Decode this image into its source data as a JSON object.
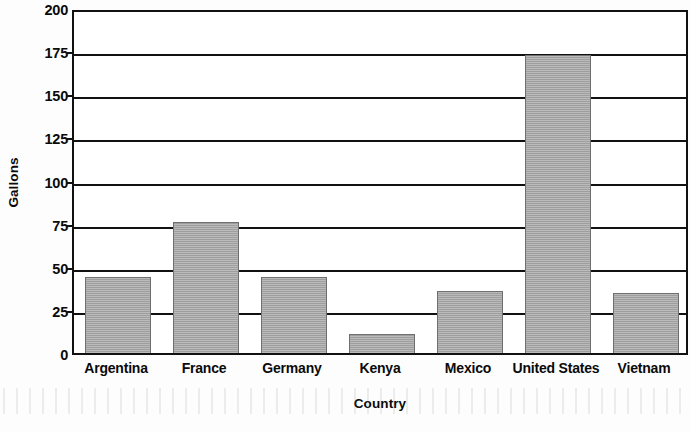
{
  "chart_data": {
    "type": "bar",
    "title": "",
    "xlabel": "Country",
    "ylabel": "Gallons",
    "categories": [
      "Argentina",
      "France",
      "Germany",
      "Kenya",
      "Mexico",
      "United States",
      "Vietnam"
    ],
    "values": [
      44,
      76,
      44,
      11,
      36,
      173,
      35
    ],
    "ylim": [
      0,
      200
    ],
    "yticks": [
      0,
      25,
      50,
      75,
      100,
      125,
      150,
      175,
      200
    ],
    "ytick_labels": [
      "0",
      "25",
      "50",
      "75",
      "100",
      "125",
      "150",
      "175",
      "200"
    ],
    "grid": "horizontal",
    "legend": "none",
    "bar_color": "#a8a8a8",
    "bar_edge_color": "#6f6f6f",
    "axis_color": "#111111",
    "plot_background": "#ffffff"
  }
}
